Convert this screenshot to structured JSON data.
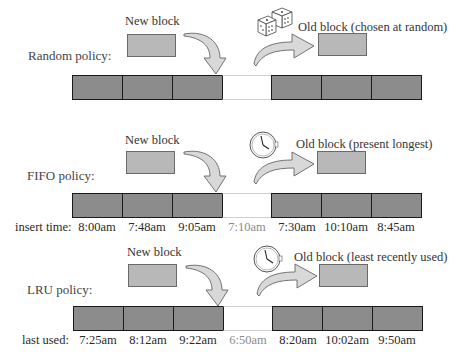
{
  "sections": [
    {
      "id": "random",
      "policy_label": "Random policy:",
      "new_block_label": "New block",
      "old_block_label": "Old block (chosen at random)",
      "selector_icon": "dice-icon",
      "times_label": null,
      "times": [],
      "empty_slot_index": 4
    },
    {
      "id": "fifo",
      "policy_label": "FIFO policy:",
      "new_block_label": "New block",
      "old_block_label": "Old block (present longest)",
      "selector_icon": "clock-icon",
      "times_label": "insert time:",
      "times": [
        "8:00am",
        "7:48am",
        "9:05am",
        "7:10am",
        "7:30am",
        "10:10am",
        "8:45am"
      ],
      "empty_slot_index": 3
    },
    {
      "id": "lru",
      "policy_label": "LRU policy:",
      "new_block_label": "New block",
      "old_block_label": "Old block (least recently used)",
      "selector_icon": "clock-icon",
      "times_label": "last used:",
      "times": [
        "7:25am",
        "8:12am",
        "9:22am",
        "6:50am",
        "8:20am",
        "10:02am",
        "9:50am"
      ],
      "empty_slot_index": 3
    }
  ],
  "colors": {
    "filled_block": "#8c8c8c",
    "small_block": "#b8b8b8",
    "empty_slot": "#ffffff",
    "faded_time": "#8a8a8a"
  }
}
